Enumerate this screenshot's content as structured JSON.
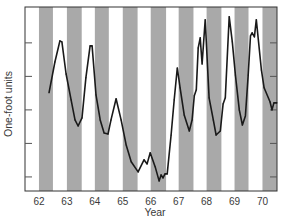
{
  "chart_data": {
    "type": "line",
    "title": "",
    "xlabel": "Year",
    "ylabel": "One-foot units",
    "xlim": [
      61.5,
      70.52
    ],
    "ylim": [
      0.58,
      6.07
    ],
    "x_ticks": [
      62,
      63,
      64,
      65,
      66,
      67,
      68,
      69,
      70
    ],
    "x_tick_labels": [
      "62",
      "63",
      "64",
      "65",
      "66",
      "67",
      "68",
      "69",
      "70"
    ],
    "y_ticks": [
      1,
      2,
      3,
      4,
      5
    ],
    "y_tick_labels": [
      "",
      "",
      "",
      "",
      ""
    ],
    "y_ticks_right": [
      1,
      2,
      3,
      4,
      5
    ],
    "shaded_bands": {
      "description": "first half of each year shaded",
      "color": "#a9a9a9",
      "ranges": [
        [
          62,
          62.5
        ],
        [
          63,
          63.53
        ],
        [
          64,
          64.5
        ],
        [
          65,
          65.53
        ],
        [
          66,
          66.55
        ],
        [
          67,
          67.53
        ],
        [
          68,
          68.53
        ],
        [
          69,
          69.5
        ],
        [
          70,
          70.52
        ]
      ]
    },
    "legend": "none",
    "grid": false,
    "line_color": "#1a1a1a",
    "series": [
      {
        "name": "One-foot units",
        "x": [
          62.36,
          62.57,
          62.75,
          62.82,
          62.97,
          63.15,
          63.29,
          63.4,
          63.54,
          63.68,
          63.83,
          63.9,
          64.04,
          64.19,
          64.33,
          64.47,
          64.58,
          64.76,
          64.94,
          65.12,
          65.3,
          65.55,
          65.76,
          65.87,
          65.98,
          66.16,
          66.3,
          66.37,
          66.44,
          66.51,
          66.59,
          66.73,
          66.84,
          66.95,
          67.05,
          67.2,
          67.38,
          67.48,
          67.56,
          67.63,
          67.7,
          67.77,
          67.84,
          67.95,
          68.09,
          68.24,
          68.34,
          68.49,
          68.59,
          68.67,
          68.81,
          68.92,
          69.03,
          69.17,
          69.28,
          69.39,
          69.49,
          69.57,
          69.63,
          69.71,
          69.78,
          69.96,
          70.06,
          70.27,
          70.34,
          70.41,
          70.52
        ],
        "y": [
          3.51,
          4.43,
          5.06,
          5.03,
          4.07,
          3.3,
          2.7,
          2.52,
          2.76,
          3.96,
          4.91,
          4.91,
          3.45,
          2.7,
          2.31,
          2.28,
          2.7,
          3.33,
          2.7,
          1.96,
          1.45,
          1.15,
          1.51,
          1.39,
          1.72,
          1.3,
          0.88,
          1.06,
          0.97,
          1.09,
          1.09,
          2.25,
          3.3,
          4.25,
          3.66,
          2.85,
          2.37,
          2.7,
          3.42,
          3.6,
          4.85,
          5.15,
          4.37,
          5.69,
          3.36,
          2.7,
          2.25,
          2.37,
          3.18,
          3.36,
          5.78,
          5.03,
          4.04,
          3.0,
          2.55,
          2.82,
          4.04,
          5.21,
          5.3,
          5.18,
          5.69,
          4.19,
          3.66,
          3.24,
          3.0,
          3.21,
          3.21
        ]
      }
    ]
  }
}
